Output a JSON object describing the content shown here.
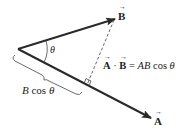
{
  "diagram": {
    "type": "vector-dot-product",
    "vectors": [
      {
        "name": "A",
        "label": "A",
        "from": [
          18,
          49
        ],
        "to": [
          151,
          118
        ]
      },
      {
        "name": "B",
        "label": "B",
        "from": [
          18,
          49
        ],
        "to": [
          115,
          19
        ]
      }
    ],
    "angle_label": "θ",
    "projection_label_prefix": "B",
    "projection_label_cos": "cos",
    "projection_label_theta": "θ",
    "formula": {
      "lhs_a": "A",
      "dot": "·",
      "lhs_b": "B",
      "equals": "=",
      "rhs": "AB",
      "cos": "cos",
      "theta": "θ"
    },
    "colors": {
      "stroke": "#2a2a2a",
      "text": "#222222"
    }
  }
}
